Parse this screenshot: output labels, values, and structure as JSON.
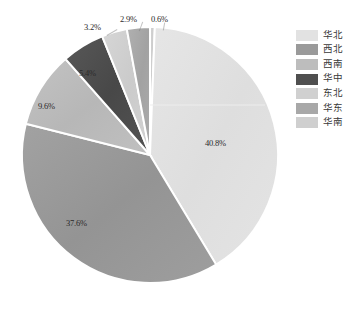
{
  "chart_data": {
    "type": "pie",
    "title": "",
    "labels": [
      "华北",
      "西北",
      "西南",
      "华中",
      "东北",
      "华东",
      "华南"
    ],
    "values": [
      40.8,
      37.6,
      9.6,
      5.4,
      3.2,
      2.9,
      0.6
    ],
    "value_labels": [
      "40.8%",
      "37.6%",
      "9.6%",
      "5.4%",
      "3.2%",
      "2.9%",
      "0.6%"
    ],
    "colors": [
      "#e2e2e2",
      "#9a9a9a",
      "#bdbdbd",
      "#4f4f4f",
      "#d0d0d0",
      "#a8a8a8",
      "#cfcfcf"
    ],
    "legend_position": "right",
    "grid": false,
    "start_angle_deg": 0,
    "direction": "clockwise",
    "units": "percent"
  },
  "legend": {
    "items": [
      {
        "label": "华北",
        "color": "#e2e2e2"
      },
      {
        "label": "西北",
        "color": "#9a9a9a"
      },
      {
        "label": "西南",
        "color": "#bdbdbd"
      },
      {
        "label": "华中",
        "color": "#4f4f4f"
      },
      {
        "label": "东北",
        "color": "#d0d0d0"
      },
      {
        "label": "华东",
        "color": "#a8a8a8"
      },
      {
        "label": "华南",
        "color": "#cfcfcf"
      }
    ]
  },
  "slice_labels": [
    {
      "text": "40.8%",
      "x": 205,
      "y": 138
    },
    {
      "text": "37.6%",
      "x": 66,
      "y": 218
    },
    {
      "text": "9.6%",
      "x": 38,
      "y": 101
    },
    {
      "text": "5.4%",
      "x": 79,
      "y": 68
    },
    {
      "text": "3.2%",
      "x": 84,
      "y": 22
    },
    {
      "text": "2.9%",
      "x": 120,
      "y": 14
    },
    {
      "text": "0.6%",
      "x": 151,
      "y": 14
    }
  ]
}
